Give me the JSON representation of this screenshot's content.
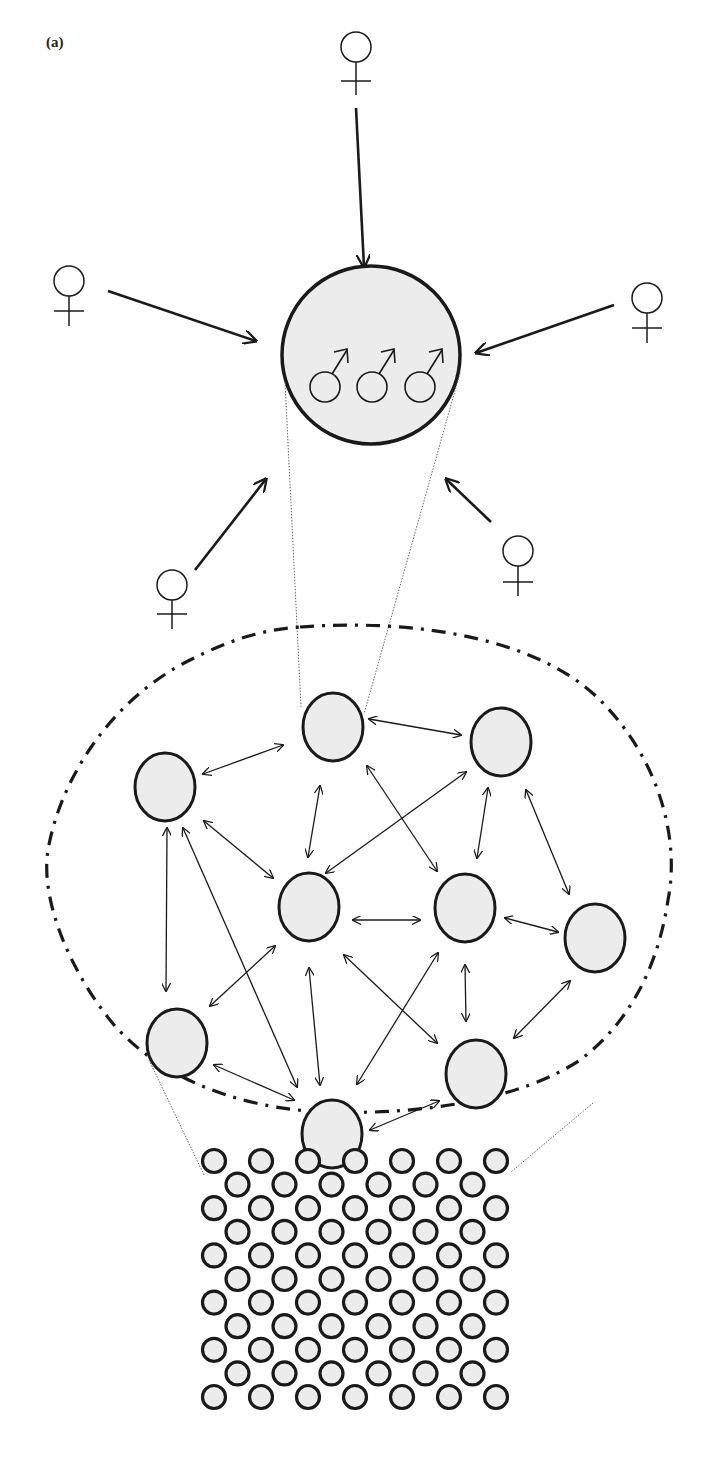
{
  "panel_label": "(a)",
  "colors": {
    "stroke": "#1a1a1a",
    "node_fill": "#ececec",
    "background": "#ffffff"
  },
  "symbols": {
    "female": "♀",
    "male": "♂"
  },
  "top_group": {
    "description": "large circle containing three male symbols, with five female symbols pointing arrows toward it",
    "male_count": 3,
    "female_count": 5
  },
  "network": {
    "description": "population of 9 groups connected by bidirectional arrows inside dash-dot boundary",
    "node_count": 9,
    "nodes": [
      {
        "id": "A",
        "x": 165,
        "y": 787
      },
      {
        "id": "B",
        "x": 333,
        "y": 727
      },
      {
        "id": "C",
        "x": 501,
        "y": 742
      },
      {
        "id": "D",
        "x": 309,
        "y": 907
      },
      {
        "id": "E",
        "x": 465,
        "y": 908
      },
      {
        "id": "F",
        "x": 595,
        "y": 938
      },
      {
        "id": "G",
        "x": 177,
        "y": 1043
      },
      {
        "id": "H",
        "x": 332,
        "y": 1134
      },
      {
        "id": "I",
        "x": 476,
        "y": 1074
      }
    ],
    "edges": [
      [
        "A",
        "B"
      ],
      [
        "B",
        "C"
      ],
      [
        "A",
        "D"
      ],
      [
        "A",
        "G"
      ],
      [
        "A",
        "H"
      ],
      [
        "B",
        "D"
      ],
      [
        "B",
        "E"
      ],
      [
        "C",
        "D"
      ],
      [
        "C",
        "E"
      ],
      [
        "C",
        "F"
      ],
      [
        "D",
        "E"
      ],
      [
        "E",
        "F"
      ],
      [
        "D",
        "G"
      ],
      [
        "D",
        "H"
      ],
      [
        "D",
        "I"
      ],
      [
        "E",
        "H"
      ],
      [
        "E",
        "I"
      ],
      [
        "F",
        "I"
      ],
      [
        "G",
        "H"
      ],
      [
        "H",
        "I"
      ]
    ]
  },
  "lattice": {
    "description": "hexagonal packing of small circles",
    "rows": 11,
    "odd_row_count": 7,
    "even_row_count": 6
  }
}
